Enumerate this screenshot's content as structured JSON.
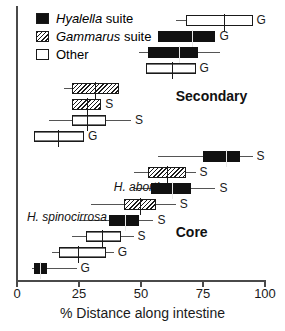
{
  "chart_data": {
    "type": "box",
    "title": "",
    "xlabel": "% Distance along intestine",
    "ylabel": "",
    "xlim": [
      0,
      100
    ],
    "xticks": [
      0,
      25,
      50,
      75,
      100
    ],
    "xtick_labels": [
      "0",
      "25",
      "50",
      "75",
      "100"
    ],
    "grid": false,
    "legend_position": "top-left",
    "legend": [
      {
        "key": "hyalella",
        "label_italic": "Hyalella",
        "label_rest": " suite",
        "fill": "solid"
      },
      {
        "key": "gammarus",
        "label_italic": "Gammarus",
        "label_rest": " suite",
        "fill": "hatch"
      },
      {
        "key": "other",
        "label_italic": "",
        "label_rest": "Other",
        "fill": "open"
      }
    ],
    "annotations": [
      {
        "name": "secondary",
        "text": "Secondary",
        "x_pct": 64,
        "y_px": 88
      },
      {
        "name": "core",
        "text": "Core",
        "x_pct": 64,
        "y_px": 224
      },
      {
        "name": "h-abortiva",
        "text": "H. abortiva",
        "x_pct": 39,
        "y_px": 180
      },
      {
        "name": "h-spinocirrosa",
        "text": "H. spinocirrosa",
        "x_pct": 4,
        "y_px": 210
      }
    ],
    "boxes": [
      {
        "id": 1,
        "y_px": 14,
        "fill": "open",
        "whisk_lo": 64.0,
        "q1": 68.0,
        "median": 83.0,
        "q3": 95.0,
        "whisk_hi": 95.0,
        "tag": "G"
      },
      {
        "id": 2,
        "y_px": 30,
        "fill": "solid",
        "whisk_lo": 57.0,
        "q1": 57.0,
        "median": 70.0,
        "q3": 80.0,
        "whisk_hi": 80.0,
        "tag": "G"
      },
      {
        "id": 3,
        "y_px": 46,
        "fill": "solid",
        "whisk_lo": 49.0,
        "q1": 53.0,
        "median": 65.0,
        "q3": 73.0,
        "whisk_hi": 82.0,
        "tag": ""
      },
      {
        "id": 4,
        "y_px": 62,
        "fill": "open2",
        "whisk_lo": 52.0,
        "q1": 52.0,
        "median": 62.0,
        "q3": 72.0,
        "whisk_hi": 72.0,
        "tag": "G"
      },
      {
        "id": 5,
        "y_px": 82,
        "fill": "hatch",
        "whisk_lo": 19.0,
        "q1": 22.0,
        "median": 31.0,
        "q3": 41.0,
        "whisk_hi": 41.0,
        "tag": ""
      },
      {
        "id": 6,
        "y_px": 98,
        "fill": "hatch",
        "whisk_lo": 22.0,
        "q1": 22.0,
        "median": 28.0,
        "q3": 34.0,
        "whisk_hi": 34.0,
        "tag": "S"
      },
      {
        "id": 7,
        "y_px": 114,
        "fill": "open2",
        "whisk_lo": 13.0,
        "q1": 22.0,
        "median": 28.0,
        "q3": 36.0,
        "whisk_hi": 46.0,
        "tag": "S"
      },
      {
        "id": 8,
        "y_px": 130,
        "fill": "open2",
        "whisk_lo": 7.0,
        "q1": 7.0,
        "median": 16.0,
        "q3": 27.0,
        "whisk_hi": 27.0,
        "tag": "G"
      },
      {
        "id": 9,
        "y_px": 150,
        "fill": "solid",
        "whisk_lo": 57.0,
        "q1": 75.0,
        "median": 84.0,
        "q3": 90.0,
        "whisk_hi": 95.0,
        "tag": "S"
      },
      {
        "id": 10,
        "y_px": 166,
        "fill": "hatch",
        "whisk_lo": 47.0,
        "q1": 53.0,
        "median": 60.0,
        "q3": 68.0,
        "whisk_hi": 72.0,
        "tag": "S"
      },
      {
        "id": 11,
        "y_px": 182,
        "fill": "solid",
        "whisk_lo": 47.0,
        "q1": 54.0,
        "median": 62.0,
        "q3": 70.0,
        "whisk_hi": 80.0,
        "tag": "S"
      },
      {
        "id": 12,
        "y_px": 198,
        "fill": "hatch",
        "whisk_lo": 30.0,
        "q1": 43.0,
        "median": 49.0,
        "q3": 56.0,
        "whisk_hi": 64.0,
        "tag": "S"
      },
      {
        "id": 13,
        "y_px": 214,
        "fill": "solid",
        "whisk_lo": 25.0,
        "q1": 37.0,
        "median": 43.0,
        "q3": 49.0,
        "whisk_hi": 55.0,
        "tag": "S"
      },
      {
        "id": 14,
        "y_px": 230,
        "fill": "open2",
        "whisk_lo": 22.0,
        "q1": 28.0,
        "median": 34.0,
        "q3": 42.0,
        "whisk_hi": 47.0,
        "tag": "S"
      },
      {
        "id": 15,
        "y_px": 246,
        "fill": "open2",
        "whisk_lo": 14.0,
        "q1": 17.0,
        "median": 24.0,
        "q3": 36.0,
        "whisk_hi": 39.0,
        "tag": "G"
      },
      {
        "id": 16,
        "y_px": 262,
        "fill": "solid",
        "whisk_lo": 6.0,
        "q1": 7.0,
        "median": 9.0,
        "q3": 12.0,
        "whisk_hi": 24.0,
        "tag": "G"
      }
    ]
  }
}
